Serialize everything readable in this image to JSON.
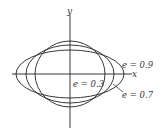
{
  "figure": {
    "axes": {
      "x_label": "x",
      "y_label": "y"
    },
    "curves": [
      {
        "eccentricity": 0.3,
        "label": "e = 0.3"
      },
      {
        "eccentricity": 0.7,
        "label": "e = 0.7"
      },
      {
        "eccentricity": 0.9,
        "label": "e = 0.9"
      }
    ],
    "labels": {
      "e03": "e = 0.3",
      "e07": "e = 0.7",
      "e09": "e = 0.9"
    },
    "colors": {
      "stroke": "#222222",
      "background": "#ffffff"
    }
  }
}
